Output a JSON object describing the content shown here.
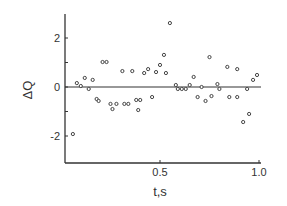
{
  "chart_data": {
    "type": "scatter",
    "title": "",
    "xlabel": "t,s",
    "ylabel": "ΔQ",
    "xlim": [
      0.0,
      1.0
    ],
    "ylim": [
      -2.8,
      3.0
    ],
    "x_ticks": [
      {
        "value": 0.5,
        "label": "0.5"
      },
      {
        "value": 1.0,
        "label": "1.0"
      }
    ],
    "y_ticks": [
      {
        "value": 2,
        "label": "2"
      },
      {
        "value": 1,
        "label": ""
      },
      {
        "value": 0,
        "label": "0"
      },
      {
        "value": -1,
        "label": ""
      },
      {
        "value": -2,
        "label": "-2"
      }
    ],
    "grid": false,
    "legend": null,
    "reference_line": {
      "y": 0
    },
    "marker": "open-circle",
    "series": [
      {
        "name": "ΔQ",
        "x": [
          0.06,
          0.08,
          0.1,
          0.12,
          0.14,
          0.16,
          0.18,
          0.19,
          0.21,
          0.23,
          0.25,
          0.26,
          0.28,
          0.31,
          0.32,
          0.34,
          0.36,
          0.38,
          0.39,
          0.4,
          0.42,
          0.44,
          0.46,
          0.48,
          0.5,
          0.52,
          0.53,
          0.55,
          0.58,
          0.59,
          0.61,
          0.63,
          0.65,
          0.67,
          0.69,
          0.71,
          0.73,
          0.75,
          0.76,
          0.79,
          0.8,
          0.84,
          0.85,
          0.89,
          0.89,
          0.92,
          0.94,
          0.95,
          0.97,
          0.99
        ],
        "y": [
          -1.92,
          0.16,
          0.04,
          0.37,
          -0.08,
          0.29,
          -0.49,
          -0.57,
          1.02,
          1.02,
          -0.69,
          -0.9,
          -0.69,
          0.65,
          -0.69,
          -0.69,
          0.65,
          -0.53,
          -0.94,
          -0.53,
          0.57,
          0.73,
          -0.41,
          0.61,
          0.9,
          1.31,
          0.57,
          2.61,
          0.08,
          -0.08,
          -0.08,
          -0.08,
          0.08,
          0.41,
          -0.41,
          0.0,
          -0.57,
          1.22,
          -0.37,
          0.12,
          -0.08,
          0.82,
          -0.41,
          0.73,
          -0.41,
          -1.43,
          -0.08,
          -1.1,
          0.29,
          0.49
        ]
      }
    ]
  },
  "colors": {
    "axis": "#333333",
    "marker": "#444444",
    "background": "#ffffff"
  }
}
